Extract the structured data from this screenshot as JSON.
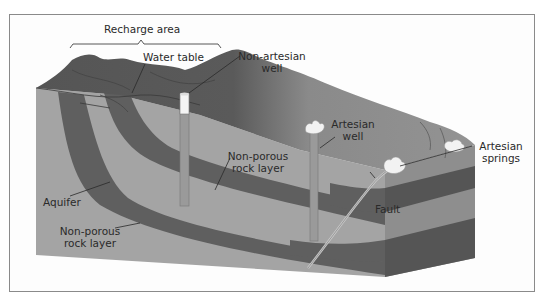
{
  "diagram": {
    "type": "geological cross-section",
    "colors": {
      "background": "#fdfdfd",
      "frame_border": "#8a8a8a",
      "non_porous_rock": "#5e5e5e",
      "aquifer": "#a2a2a2",
      "surface_dark": "#5a5a5a",
      "surface_light": "#8c8c8c",
      "side_face_light": "#8e8e8e",
      "side_face_dark": "#4e4e4e",
      "well_casing": "#9a9a9a",
      "water_spray": "#f2f2f2",
      "label_text": "#2a2a2a",
      "leader_line": "#2a2a2a"
    },
    "labels": {
      "recharge_area": "Recharge area",
      "water_table": "Water table",
      "non_artesian_well_line1": "Non-artesian",
      "non_artesian_well_line2": "well",
      "artesian_well_line1": "Artesian",
      "artesian_well_line2": "well",
      "artesian_springs_line1": "Artesian",
      "artesian_springs_line2": "springs",
      "non_porous_upper_line1": "Non-porous",
      "non_porous_upper_line2": "rock layer",
      "aquifer": "Aquifer",
      "non_porous_lower_line1": "Non-porous",
      "non_porous_lower_line2": "rock layer",
      "fault": "Fault"
    }
  }
}
